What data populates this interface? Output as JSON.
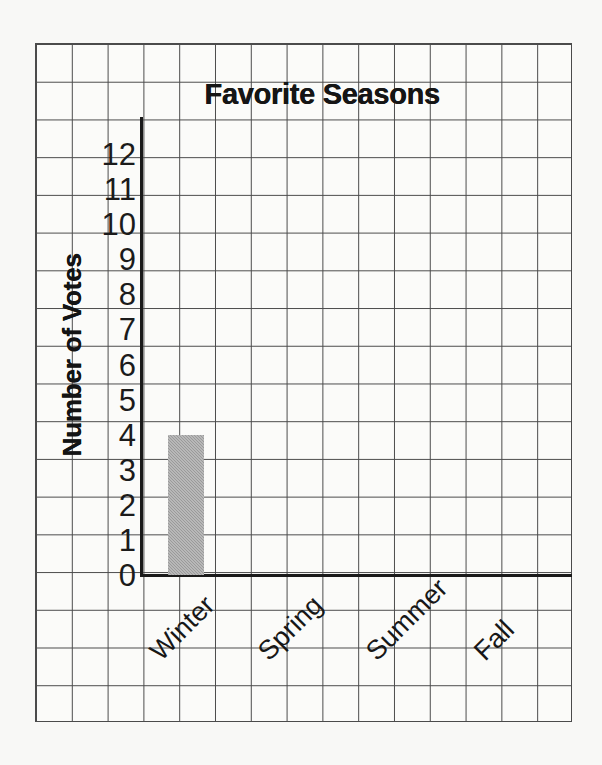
{
  "background_color": "#f8f8f6",
  "grid": {
    "line_color": "#4b4b4b",
    "cell_width_px": 35.8,
    "cell_height_px": 37.7
  },
  "axis": {
    "color": "#1a1a1a"
  },
  "chart_data": {
    "type": "bar",
    "title": "Favorite Seasons",
    "xlabel": "",
    "ylabel": "Number of Votes",
    "categories": [
      "Winter",
      "Spring",
      "Summer",
      "Fall"
    ],
    "values": [
      4,
      0,
      0,
      0
    ],
    "ylim": [
      0,
      12
    ],
    "ytick_labels": [
      "12",
      "11",
      "10",
      "9",
      "8",
      "7",
      "6",
      "5",
      "4",
      "3",
      "2",
      "1",
      "0"
    ],
    "ytick_values": [
      12,
      11,
      10,
      9,
      8,
      7,
      6,
      5,
      4,
      3,
      2,
      1,
      0
    ],
    "grid": true,
    "legend": "none",
    "bar_color": "#9a9a9a"
  }
}
